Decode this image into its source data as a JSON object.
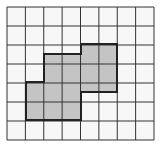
{
  "diagram": {
    "type": "grid-shape",
    "grid": {
      "columns": 8,
      "rows": 7,
      "origin_px": [
        7,
        7
      ],
      "size_px": [
        147,
        133
      ],
      "line_color": "#333333",
      "background": "#f7f7f7"
    },
    "shape": {
      "fill": "#c4c4c4",
      "stroke": "#222222",
      "points_px": [
        [
          81,
          44
        ],
        [
          117,
          44
        ],
        [
          117,
          92
        ],
        [
          81,
          92
        ],
        [
          81,
          120
        ],
        [
          26,
          120
        ],
        [
          26,
          82
        ],
        [
          44,
          82
        ],
        [
          44,
          54
        ],
        [
          81,
          54
        ]
      ]
    }
  }
}
